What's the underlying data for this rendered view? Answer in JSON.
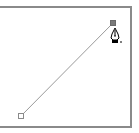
{
  "canvas": {
    "background": "#ffffff",
    "frame_color": "#8a8a8a"
  },
  "path": {
    "stroke_color": "#9a9a9a",
    "start_anchor": {
      "x": 21,
      "y": 116,
      "state": "unselected",
      "fill": "#ffffff",
      "stroke": "#8a8a8a"
    },
    "end_anchor": {
      "x": 113,
      "y": 23,
      "state": "selected",
      "fill": "#7a7a7a",
      "stroke": "#6a6a6a"
    }
  },
  "cursor": {
    "icon": "pen-tool-icon",
    "x": 115,
    "y": 28
  }
}
